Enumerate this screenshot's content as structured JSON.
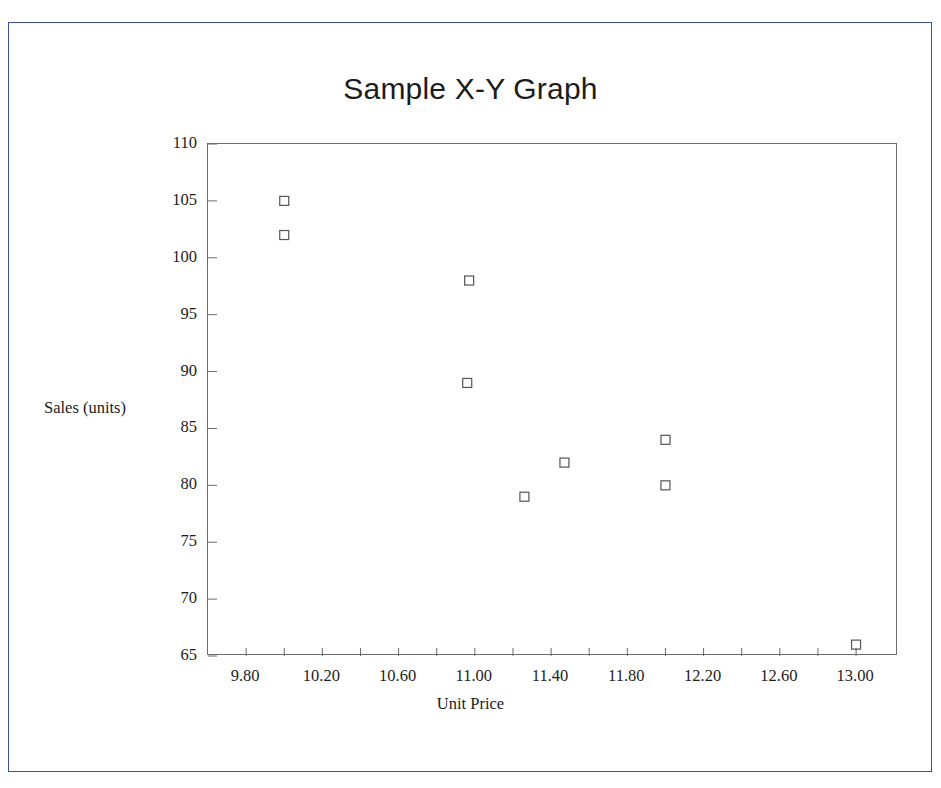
{
  "frame": {
    "border_color": "#3b4fa0",
    "background": "#ffffff"
  },
  "chart_data": {
    "type": "scatter",
    "title": "Sample X-Y Graph",
    "xlabel": "Unit Price",
    "ylabel": "Sales (units)",
    "xlim": [
      9.6,
      13.22
    ],
    "ylim": [
      65,
      110
    ],
    "grid": false,
    "legend": null,
    "marker": {
      "shape": "open-square",
      "size_px": 9,
      "stroke": "#555555",
      "fill": "none"
    },
    "x_ticks_major": [
      9.8,
      10.2,
      10.6,
      11.0,
      11.4,
      11.8,
      12.2,
      12.6,
      13.0
    ],
    "x_tick_labels": [
      "9.80",
      "10.20",
      "10.60",
      "11.00",
      "11.40",
      "11.80",
      "12.20",
      "12.60",
      "13.00"
    ],
    "x_tick_step_minor": 0.2,
    "y_ticks": [
      110,
      105,
      100,
      95,
      90,
      85,
      80,
      75,
      70,
      65
    ],
    "y_tick_labels": [
      "110",
      "105",
      "100",
      "95",
      "90",
      "85",
      "80",
      "75",
      "70",
      "65"
    ],
    "points": [
      {
        "x": 10.0,
        "y": 105
      },
      {
        "x": 10.0,
        "y": 102
      },
      {
        "x": 10.97,
        "y": 98
      },
      {
        "x": 10.96,
        "y": 89
      },
      {
        "x": 11.26,
        "y": 79
      },
      {
        "x": 11.47,
        "y": 82
      },
      {
        "x": 12.0,
        "y": 84
      },
      {
        "x": 12.0,
        "y": 80
      },
      {
        "x": 13.0,
        "y": 66
      }
    ]
  }
}
